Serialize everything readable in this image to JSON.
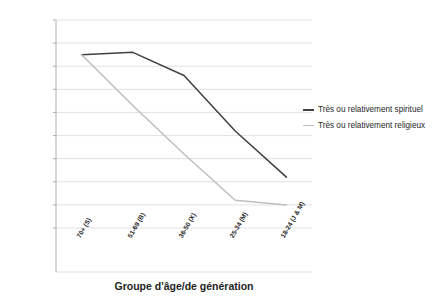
{
  "chart_data": {
    "type": "line",
    "title": "",
    "xlabel": "Groupe d'âge/de génération",
    "ylabel": "",
    "categories": [
      "70+ (S)",
      "51-69 (B)",
      "36-50 (X)",
      "25-34 (M)",
      "18-24 (J & M)"
    ],
    "series": [
      {
        "name": "Très ou relativement spirituel",
        "color": "#404040",
        "values": [
          72.5,
          73,
          68,
          56,
          46
        ]
      },
      {
        "name": "Très ou relativement religieux",
        "color": "#bfbfbf",
        "values": [
          72.5,
          61.5,
          51,
          41,
          40
        ]
      }
    ],
    "ylim": [
      35,
      80
    ],
    "yticks": [
      35,
      40,
      45,
      50,
      55,
      60,
      65,
      70,
      75,
      80
    ],
    "grid": true,
    "legend_position": "right"
  },
  "legend": {
    "items": [
      {
        "label": "Très ou relativement spirituel",
        "color": "#404040"
      },
      {
        "label": "Très ou relativement religieux",
        "color": "#bfbfbf"
      }
    ]
  },
  "axis": {
    "x_title": "Groupe d'âge/de génération"
  },
  "colors": {
    "grid": "#d9d9d9",
    "axis": "#a6a6a6",
    "text": "#262626",
    "series_spiritual": "#404040",
    "series_religious": "#bfbfbf"
  }
}
